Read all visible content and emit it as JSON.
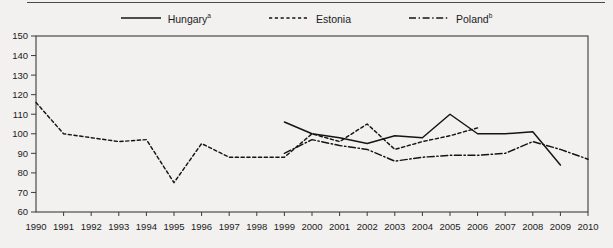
{
  "legend": {
    "entries": [
      {
        "name": "legend-hungary",
        "label": "Hungary",
        "marker": "a",
        "style": "solid",
        "color": "#141414"
      },
      {
        "name": "legend-estonia",
        "label": "Estonia",
        "marker": "",
        "style": "dotted",
        "color": "#141414"
      },
      {
        "name": "legend-poland",
        "label": "Poland",
        "marker": "b",
        "style": "dashdot",
        "color": "#141414"
      }
    ]
  },
  "chart_data": {
    "type": "line",
    "title": "",
    "subtitle": "",
    "xlabel": "",
    "ylabel": "",
    "xlim": [
      1990,
      2010
    ],
    "ylim": [
      60,
      150
    ],
    "ytick_step": 10,
    "grid": false,
    "legend_position": "top-center",
    "x": [
      1990,
      1991,
      1992,
      1993,
      1994,
      1995,
      1996,
      1997,
      1998,
      1999,
      2000,
      2001,
      2002,
      2003,
      2004,
      2005,
      2006,
      2007,
      2008,
      2009,
      2010
    ],
    "xticklabels": [
      "1990",
      "1991",
      "1992",
      "1993",
      "1994",
      "1995",
      "1996",
      "1997",
      "1998",
      "1999",
      "2000",
      "2001",
      "2002",
      "2003",
      "2004",
      "2005",
      "2006",
      "2007",
      "2008",
      "2009",
      "2010"
    ],
    "yticklabels": [
      "60",
      "70",
      "80",
      "90",
      "100",
      "110",
      "120",
      "130",
      "140",
      "150"
    ],
    "series": [
      {
        "name": "Hungary",
        "marker": "a",
        "style": "solid",
        "color": "#141414",
        "x": [
          1999,
          2000,
          2001,
          2002,
          2003,
          2004,
          2005,
          2006,
          2007,
          2008,
          2009
        ],
        "values": [
          106,
          100,
          98,
          95,
          99,
          98,
          110,
          100,
          100,
          101,
          84
        ]
      },
      {
        "name": "Estonia",
        "marker": "",
        "style": "dotted",
        "color": "#141414",
        "x": [
          1990,
          1991,
          1992,
          1993,
          1994,
          1995,
          1996,
          1997,
          1998,
          1999,
          2000,
          2001,
          2002,
          2003,
          2004,
          2005,
          2006
        ],
        "values": [
          116,
          100,
          98,
          96,
          97,
          75,
          95,
          88,
          88,
          88,
          100,
          96,
          105,
          92,
          96,
          99,
          103
        ]
      },
      {
        "name": "Poland",
        "marker": "b",
        "style": "dashdot",
        "color": "#141414",
        "x": [
          1999,
          2000,
          2001,
          2002,
          2003,
          2004,
          2005,
          2006,
          2007,
          2008,
          2009,
          2010
        ],
        "values": [
          90,
          97,
          94,
          92,
          86,
          88,
          89,
          89,
          90,
          96,
          92,
          87
        ]
      }
    ]
  }
}
